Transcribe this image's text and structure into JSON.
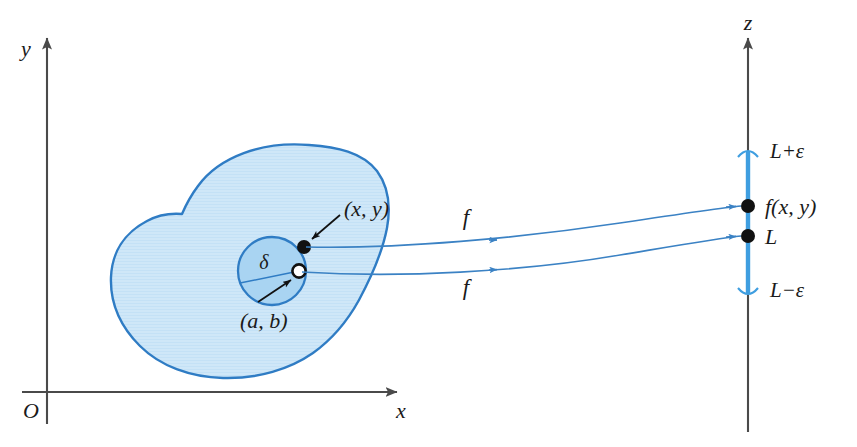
{
  "figure": {
    "colors": {
      "blob_fill": "#cfe7f8",
      "blob_stroke": "#2f7cc4",
      "disk_fill": "#a9d4f2",
      "disk_stroke": "#2f7cc4",
      "curve": "#3b82c4",
      "axis": "#4a4a4a",
      "interval": "#3f9ee0",
      "point": "#111111",
      "text": "#1a1a1a",
      "background": "#ffffff"
    }
  },
  "domain_plane": {
    "y_axis_label": "y",
    "x_axis_label": "x",
    "origin_label": "O",
    "region_name": "D",
    "delta_label": "δ",
    "inner_point_label": "(a, b)",
    "outer_point_label": "(x, y)"
  },
  "map_arrows": [
    {
      "label": "f",
      "name": "f-upper"
    },
    {
      "label": "f",
      "name": "f-lower"
    }
  ],
  "range_axis": {
    "axis_label": "z",
    "upper_bound_label": "L+ε",
    "lower_bound_label": "L−ε",
    "value_label": "f(x, y)",
    "limit_label": "L"
  }
}
